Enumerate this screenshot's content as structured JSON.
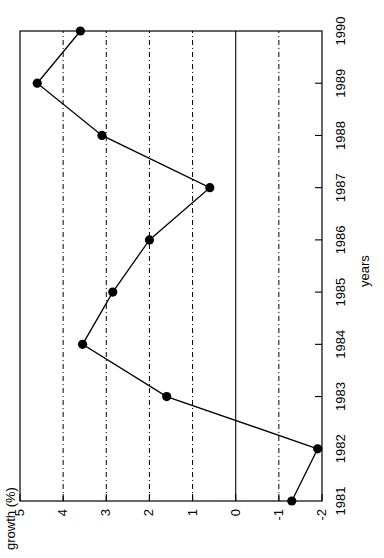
{
  "chart_data": {
    "type": "line",
    "title": "",
    "xlabel": "years",
    "ylabel": "growth (%)",
    "categories": [
      "1981",
      "1982",
      "1983",
      "1984",
      "1985",
      "1986",
      "1987",
      "1988",
      "1989",
      "1990"
    ],
    "x": [
      1981,
      1982,
      1983,
      1984,
      1985,
      1986,
      1987,
      1988,
      1989,
      1990
    ],
    "values": [
      -1.3,
      -1.9,
      1.6,
      3.55,
      2.85,
      2.0,
      0.6,
      3.1,
      4.6,
      3.6
    ],
    "series": [
      {
        "name": "growth",
        "values": [
          -1.3,
          -1.9,
          1.6,
          3.55,
          2.85,
          2.0,
          0.6,
          3.1,
          4.6,
          3.6
        ]
      }
    ],
    "xlim": [
      1981,
      1990
    ],
    "ylim": [
      -2,
      5
    ],
    "ytick_labels": [
      "5",
      "4",
      "3",
      "2",
      "1",
      "0",
      "-1",
      "-2"
    ],
    "ytick_values": [
      5,
      4,
      3,
      2,
      1,
      0,
      -1,
      -2
    ],
    "xtick_labels": [
      "1981",
      "1982",
      "1983",
      "1984",
      "1985",
      "1986",
      "1987",
      "1988",
      "1989",
      "1990"
    ],
    "grid": "horizontal-dashed",
    "grid_lines_at": [
      4,
      3,
      2,
      1,
      -1
    ],
    "zero_line": 0,
    "legend": "none",
    "marker": "filled-circle",
    "line_color": "#000000",
    "marker_color": "#000000",
    "background_color": "#ffffff",
    "orientation": "rotated-90-ccw"
  },
  "axes": {
    "y_title": "growth (%)",
    "x_title": "years"
  }
}
